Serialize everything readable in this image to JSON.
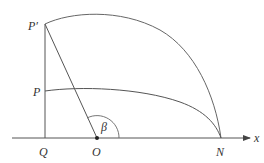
{
  "diagram": {
    "labels": {
      "p_prime": "P′",
      "p": "P",
      "q": "Q",
      "o": "O",
      "n": "N",
      "x_axis": "x",
      "beta": "β"
    },
    "colors": {
      "stroke": "#555555",
      "text": "#333333",
      "background": "#ffffff"
    },
    "points": {
      "P_prime": [
        45,
        24
      ],
      "P": [
        45,
        91
      ],
      "Q": [
        45,
        138
      ],
      "O": [
        97,
        138
      ],
      "N": [
        221,
        138
      ]
    }
  }
}
